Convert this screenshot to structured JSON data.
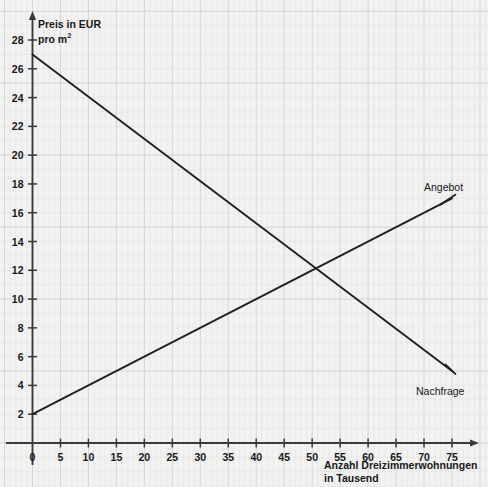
{
  "chart_data": {
    "type": "line",
    "title": "",
    "subtitle": "",
    "xlabel": "Anzahl Dreizimmerwohnungen in Tausend",
    "xlabel_line1": "Anzahl Dreizimmerwohnungen",
    "xlabel_line2": "in Tausend",
    "ylabel": "Preis in EUR pro m²",
    "ylabel_line1": "Preis in EUR",
    "ylabel_line2_text": "pro m",
    "ylabel_line2_sup": "2",
    "xlim": [
      0,
      77
    ],
    "ylim": [
      0,
      29
    ],
    "xticks": [
      0,
      5,
      10,
      15,
      20,
      25,
      30,
      35,
      40,
      45,
      50,
      55,
      60,
      65,
      70,
      75
    ],
    "yticks": [
      2,
      4,
      6,
      8,
      10,
      12,
      14,
      16,
      18,
      20,
      22,
      24,
      26,
      28
    ],
    "xtick_labels": [
      "0",
      "5",
      "10",
      "15",
      "20",
      "25",
      "30",
      "35",
      "40",
      "45",
      "50",
      "55",
      "60",
      "65",
      "70",
      "75"
    ],
    "ytick_labels": [
      "2",
      "4",
      "6",
      "8",
      "10",
      "12",
      "14",
      "16",
      "18",
      "20",
      "22",
      "24",
      "26",
      "28"
    ],
    "grid": true,
    "grid_major_step_x": 5,
    "grid_minor_per_major": 5,
    "legend": "inline-annotations",
    "origin_label": "0",
    "series": [
      {
        "name": "Angebot",
        "kind": "supply",
        "points": [
          [
            0,
            2
          ],
          [
            75,
            17
          ]
        ],
        "label_at": [
          75,
          17
        ],
        "color": "#231f20"
      },
      {
        "name": "Nachfrage",
        "kind": "demand",
        "points": [
          [
            0,
            27
          ],
          [
            75,
            5
          ]
        ],
        "label_at": [
          75,
          5
        ],
        "color": "#231f20"
      }
    ],
    "equilibrium": {
      "x": 50,
      "y": 12
    }
  },
  "colors": {
    "background": "#f2f2f0",
    "grid_minor": "#e2e2e6",
    "grid_major": "#d0d0d6",
    "axis": "#3a3a3c",
    "line": "#231f20",
    "text": "#17181a"
  }
}
